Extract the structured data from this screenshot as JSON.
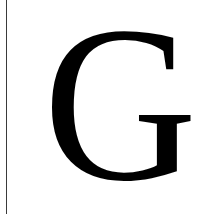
{
  "letter": {
    "character": "G",
    "color": "#000000"
  },
  "rule": {
    "color": "#3a3a3a"
  },
  "background": "#ffffff"
}
